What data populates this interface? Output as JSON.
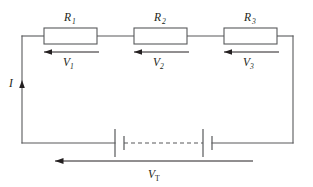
{
  "diagram": {
    "colors": {
      "wire": "#58595b",
      "text": "#231f20",
      "background": "#ffffff",
      "arrow": "#231f20"
    }
  },
  "resistors": [
    {
      "id": "r1",
      "label": "R",
      "sub": "1",
      "x": 44,
      "y": 28,
      "w": 53,
      "h": 16
    },
    {
      "id": "r2",
      "label": "R",
      "sub": "2",
      "x": 134,
      "y": 28,
      "w": 53,
      "h": 16
    },
    {
      "id": "r3",
      "label": "R",
      "sub": "3",
      "x": 224,
      "y": 28,
      "w": 53,
      "h": 16
    }
  ],
  "voltage_drops": [
    {
      "id": "v1",
      "label": "V",
      "sub": "1",
      "arrow_direction": "left"
    },
    {
      "id": "v2",
      "label": "V",
      "sub": "2",
      "arrow_direction": "left"
    },
    {
      "id": "v3",
      "label": "V",
      "sub": "3",
      "arrow_direction": "left"
    }
  ],
  "current": {
    "label": "I",
    "arrow_direction": "up",
    "position": "left-wire"
  },
  "total_voltage": {
    "label": "V",
    "sub": "T",
    "arrow_direction": "left",
    "position": "bottom"
  },
  "battery": {
    "name": "multi-cell-battery",
    "cells": 2,
    "link_style": "dashed",
    "left_cell": {
      "long_plate_x": 115,
      "short_plate_x": 124
    },
    "right_cell": {
      "long_plate_x": 203,
      "short_plate_x": 212
    }
  },
  "frame": {
    "left_x": 22,
    "right_x": 293,
    "top_y": 36,
    "bottom_y": 143
  }
}
